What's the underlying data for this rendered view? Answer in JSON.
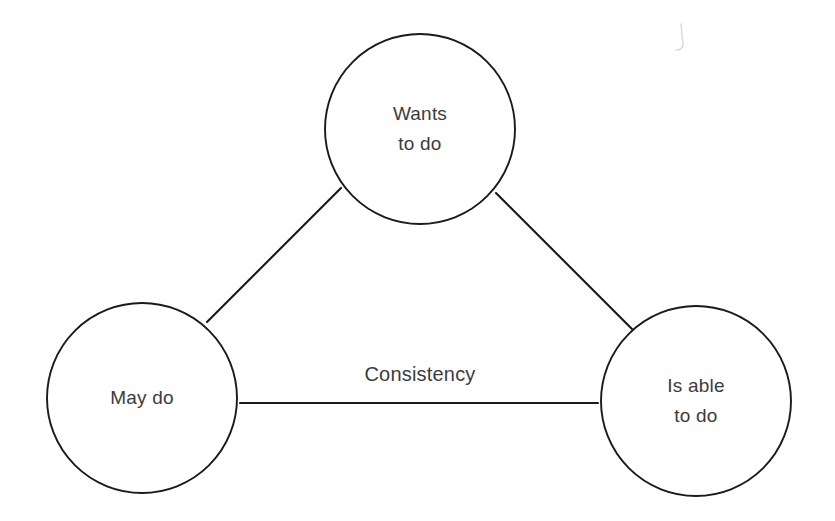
{
  "diagram": {
    "background_color": "#ffffff",
    "stroke_color": "#1a1a1a",
    "text_color": "#3c3c3c",
    "nodes": [
      {
        "id": "wants-to-do",
        "name": "wants-to-do-node",
        "line1": "Wants",
        "line2": "to do",
        "cx": 420,
        "cy": 129,
        "r": 95
      },
      {
        "id": "may-do",
        "name": "may-do-node",
        "line1": "May do",
        "line2": "",
        "cx": 142,
        "cy": 398,
        "r": 95
      },
      {
        "id": "is-able-to-do",
        "name": "is-able-to-do-node",
        "line1": "Is able",
        "line2": "to do",
        "cx": 696,
        "cy": 401,
        "r": 95
      }
    ],
    "edges": [
      {
        "id": "may-do-to-wants-to-do",
        "name": "edge-may-do-wants-to-do",
        "label": "",
        "x1": 207,
        "y1": 322,
        "x2": 341,
        "y2": 188
      },
      {
        "id": "wants-to-do-to-is-able-to-do",
        "name": "edge-wants-to-do-is-able-to-do",
        "label": "",
        "x1": 496,
        "y1": 193,
        "x2": 634,
        "y2": 331
      },
      {
        "id": "may-do-to-is-able-to-do",
        "name": "edge-may-do-is-able-to-do",
        "label": "Consistency",
        "x1": 240,
        "y1": 403,
        "x2": 598,
        "y2": 403,
        "label_x": 420,
        "label_y": 381
      }
    ]
  }
}
